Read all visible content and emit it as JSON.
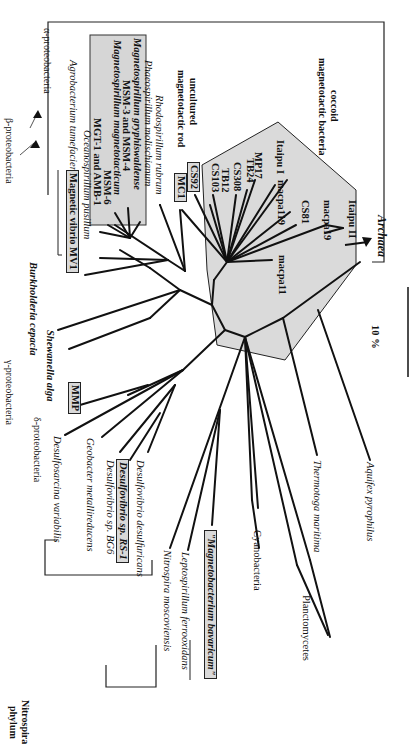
{
  "figure": {
    "type": "unrooted phylogenetic tree (rotated 90°)",
    "scale_bar_label": "10 %",
    "groups": [
      {
        "label": "α-proteobacteria"
      },
      {
        "label": "β-proteobacteria"
      },
      {
        "label": "γ-proteobacteria"
      },
      {
        "label": "δ-proteobacteria"
      },
      {
        "label": "Nitrospira phylum",
        "lines": [
          "Nitrospira",
          "phylum"
        ]
      }
    ],
    "clade_notes": {
      "uncultured_rod": [
        "uncultured",
        "magnetotactic rod"
      ],
      "coccoid": [
        "coccoid",
        "magnetotactic bacteria"
      ]
    },
    "alpha_taxa": [
      {
        "label": "Agrobacterium tumefaciens",
        "style": "italic"
      },
      {
        "label": "Magnetic vibrio MV1",
        "style": "bold-boxed"
      },
      {
        "label": "Oceanospirillum pusillum",
        "style": "italic"
      },
      {
        "label": "MGT-1 and AMB-1",
        "style": "bold"
      },
      {
        "label": "MSM-6",
        "style": "bold"
      },
      {
        "label": "Magnetospirillum magnetotacticum",
        "style": "bold-italic"
      },
      {
        "label": "MSM-3 and MSM-4",
        "style": "bold"
      },
      {
        "label": "Magnetospirillum gryphiswaldense",
        "style": "bold-italic"
      },
      {
        "label": "Phaeospirillum molischianum",
        "style": "italic"
      },
      {
        "label": "Rhodospirillum rubrum",
        "style": "italic"
      },
      {
        "label": "MC1",
        "style": "bold-boxed"
      },
      {
        "label": "CS92",
        "style": "bold-boxed"
      }
    ],
    "coccoid_taxa": [
      {
        "label": "CS103"
      },
      {
        "label": "TB12"
      },
      {
        "label": "CS308"
      },
      {
        "label": "TB24"
      },
      {
        "label": "MP17"
      },
      {
        "label": "Itaipu I"
      },
      {
        "label": "macpa119"
      },
      {
        "label": "CS81"
      },
      {
        "label": "macpa19"
      },
      {
        "label": "Itaipu II"
      },
      {
        "label": "macpa11"
      }
    ],
    "other_taxa": {
      "beta": {
        "label": "Burkholderia cepacia",
        "style": "italic"
      },
      "gamma": {
        "label": "Shewanella alga",
        "style": "italic"
      },
      "archaea": {
        "label": "Archaea",
        "style": "italic"
      },
      "delta": [
        {
          "label": "MMP",
          "style": "bold-boxed"
        },
        {
          "label": "Desulfosarcina variabilis",
          "style": "italic"
        },
        {
          "label": "Geobacter metallireducens",
          "style": "italic"
        },
        {
          "label": "Desulfovibrio sp. BG6",
          "style": "italic"
        },
        {
          "label": "Desulfovibrio sp. RS-1",
          "style": "bold-italic-boxed"
        },
        {
          "label": "Desulfovibrio desulfuricans",
          "style": "italic"
        }
      ],
      "nitrospira": [
        {
          "label": "Nitrospira moscoviensis",
          "style": "italic"
        },
        {
          "label": "Leptospirillum ferrooxidans",
          "style": "italic"
        },
        {
          "label": "\"Magnetobacterium bavaricum\"",
          "style": "bold-italic-boxed"
        }
      ],
      "deep": [
        {
          "label": "Cyanobacteria"
        },
        {
          "label": "Planctomycetes"
        },
        {
          "label": "Thermotoga maritima",
          "style": "italic"
        },
        {
          "label": "Aquifex pyrophilus",
          "style": "italic"
        }
      ]
    }
  }
}
